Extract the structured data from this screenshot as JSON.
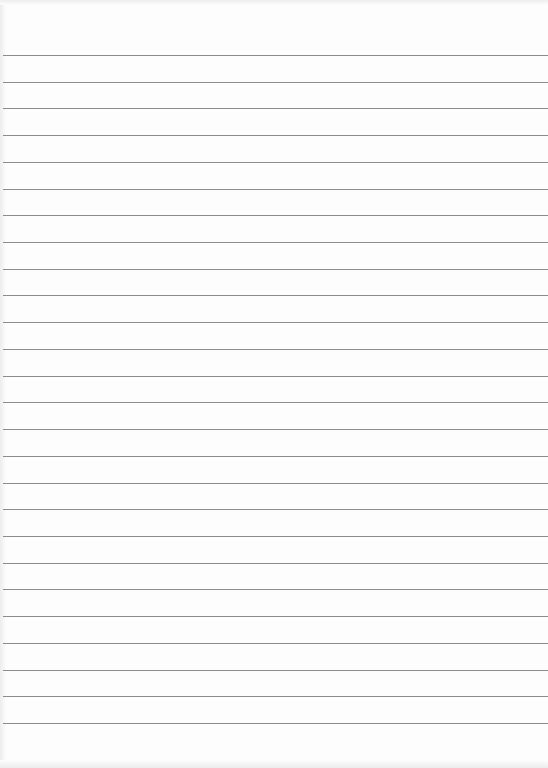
{
  "document": {
    "type": "ruled-paper",
    "background_color": "#fdfdfd",
    "rule_color": "#8c8c8c",
    "rule_count": 26,
    "first_rule_y": 55,
    "rule_spacing": 26.72,
    "text_content": []
  }
}
